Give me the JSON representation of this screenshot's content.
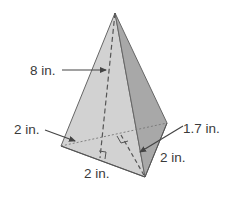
{
  "figure": {
    "type": "triangular-pyramid",
    "colors": {
      "front_face": "#cfcfcf",
      "right_face": "#a9a9a9",
      "edge": "#555555",
      "label": "#3a3a3a",
      "background": "#ffffff"
    },
    "labels": {
      "height": "8 in.",
      "base_left": "2 in.",
      "base_bottom": "2 in.",
      "base_right": "2 in.",
      "base_altitude": "1.7 in."
    }
  }
}
